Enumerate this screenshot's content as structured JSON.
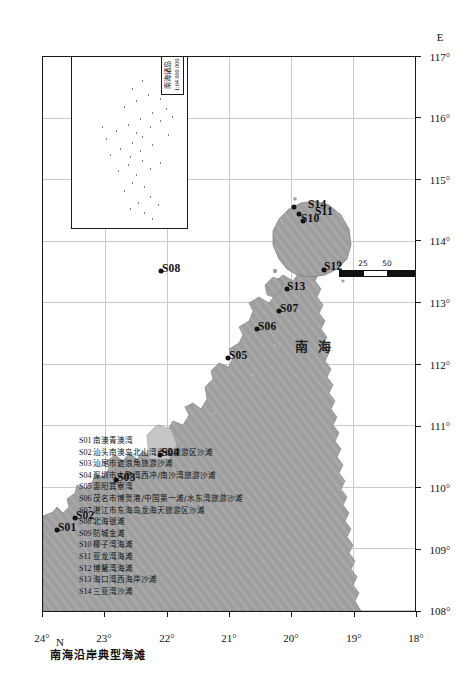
{
  "map": {
    "title": "南海沿岸典型海滩",
    "sea_label": "南 海",
    "axes": {
      "lat_unit_letter": "N",
      "lon_unit_letter": "E",
      "lat_ticks": [
        "24°",
        "23°",
        "22°",
        "21°",
        "20°",
        "19°",
        "18°"
      ],
      "lon_ticks": [
        "108°",
        "109°",
        "110°",
        "111°",
        "112°",
        "113°",
        "114°",
        "115°",
        "116°",
        "117°"
      ],
      "lat_range": [
        18,
        24
      ],
      "lon_range": [
        108,
        117
      ]
    },
    "scale_bar": {
      "ticks": [
        "0",
        "25",
        "50",
        "100"
      ],
      "unit": "km"
    },
    "inset": {
      "title": "南海诸岛",
      "scale": "1:64 000 000"
    },
    "stations": [
      {
        "code": "S01",
        "x": 80.5,
        "y": 13.5
      },
      {
        "code": "S02",
        "x": 93.0,
        "y": 31.5
      },
      {
        "code": "S03",
        "x": 130.5,
        "y": 73.0
      },
      {
        "code": "S04",
        "x": 155.5,
        "y": 117.0
      },
      {
        "code": "S05",
        "x": 253.0,
        "y": 184.5
      },
      {
        "code": "S06",
        "x": 282.0,
        "y": 214.0
      },
      {
        "code": "S07",
        "x": 299.5,
        "y": 235.5
      },
      {
        "code": "S08",
        "x": 339.5,
        "y": 118.0
      },
      {
        "code": "S09",
        "x": 390.5,
        "y": 108.0
      },
      {
        "code": "S10",
        "x": 390.0,
        "y": 259.5
      },
      {
        "code": "S11",
        "x": 396.5,
        "y": 256.0
      },
      {
        "code": "S12",
        "x": 341.0,
        "y": 280.5
      },
      {
        "code": "S13",
        "x": 321.5,
        "y": 243.5
      },
      {
        "code": "S14",
        "x": 404.0,
        "y": 251.0
      }
    ],
    "legend": [
      {
        "code": "S01",
        "name": "南澳青澳湾"
      },
      {
        "code": "S02",
        "name": "汕头南澳岛北山湾省级旅游区沙滩"
      },
      {
        "code": "S03",
        "name": "汕尾市遮浪角旅游沙滩"
      },
      {
        "code": "S04",
        "name": "深圳市大鹏湾西冲/南沙湾旅游沙滩"
      },
      {
        "code": "S05",
        "name": "惠阳巽寮湾"
      },
      {
        "code": "S06",
        "name": "茂名市博贺港/中国第一滩/水东湾旅游沙滩"
      },
      {
        "code": "S07",
        "name": "湛江市东海岛龙海天旅游区沙滩"
      },
      {
        "code": "S08",
        "name": "北海银滩"
      },
      {
        "code": "S09",
        "name": "防城金滩"
      },
      {
        "code": "S10",
        "name": "椰子湾海滩"
      },
      {
        "code": "S11",
        "name": "亚龙湾海滩"
      },
      {
        "code": "S12",
        "name": "博鳌湾海滩"
      },
      {
        "code": "S13",
        "name": "海口湾西海岸沙滩"
      },
      {
        "code": "S14",
        "name": "三亚湾沙滩"
      }
    ]
  }
}
